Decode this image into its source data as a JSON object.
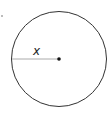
{
  "diagram": {
    "type": "circle-with-radius",
    "radius_label": "x",
    "colors": {
      "circle": "#333333",
      "radius_line": "#aaaaaa",
      "center": "#111111"
    }
  }
}
